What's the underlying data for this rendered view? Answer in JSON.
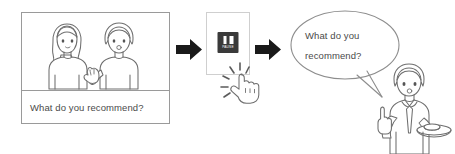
{
  "diagram": {
    "background_color": "#ffffff",
    "line_color": "#6e6e6e",
    "arrow_color": "#1a1a1a",
    "text_color": "#4a4a4a"
  },
  "panel": {
    "name": "video-frame",
    "caption": "What do you recommend?",
    "scene_description": "two-people-talking"
  },
  "arrows": [
    {
      "name": "arrow-1",
      "direction": "right"
    },
    {
      "name": "arrow-2",
      "direction": "right"
    }
  ],
  "device": {
    "name": "video-player-screen",
    "button": {
      "icon": "pause-icon",
      "label": "PAUSE",
      "color": "#3a3a3a"
    },
    "gesture": {
      "icon": "tap-hand-icon",
      "label": "tap"
    }
  },
  "speech_bubble": {
    "lines": [
      "What do you",
      "recommend?"
    ],
    "speaker": "waiter-character"
  },
  "waiter": {
    "name": "waiter-character",
    "props": [
      "tray",
      "necktie",
      "raised-index-finger"
    ]
  }
}
